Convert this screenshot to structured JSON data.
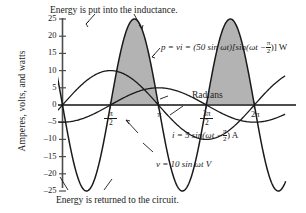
{
  "chart_data": {
    "type": "line",
    "title": "",
    "xlabel": "Radians",
    "ylabel": "Amperes, volts, and watts",
    "xlim": [
      0,
      7.3303
    ],
    "ylim": [
      -27,
      27
    ],
    "grid": false,
    "legend": "annotations",
    "x_ticks": [
      "π/2",
      "π",
      "3π/2",
      "2π"
    ],
    "x_tick_values": [
      1.5708,
      3.1416,
      4.7124,
      6.2832
    ],
    "y_ticks": [
      25,
      20,
      15,
      10,
      5,
      0,
      -5,
      -10,
      -15,
      -20,
      -25
    ],
    "y_tick_labels": [
      "25",
      "20",
      "15",
      "10",
      "5",
      "0",
      "-5",
      "-10",
      "-15",
      "-20",
      "-25"
    ],
    "series": [
      {
        "name": "p = vi",
        "equation": "p = vi = (50 sin ωt)[sin(ωt − π/2)] W",
        "amplitude": 25,
        "formula": "-25*sin(2x)",
        "shaded_positive": true,
        "shaded_color": "#b3b3b3"
      },
      {
        "name": "v",
        "equation": "v = 10 sin ωt V",
        "amplitude": 10,
        "formula": "10*sin(x)"
      },
      {
        "name": "i",
        "equation": "i = 5 sin(ωt − π/2) A",
        "amplitude": 5,
        "formula": "5*sin(x - pi/2)"
      }
    ],
    "annotations": [
      {
        "id": "top-caption",
        "text": "Energy is put into the inductance."
      },
      {
        "id": "bottom-caption",
        "text": "Energy is returned to the circuit."
      },
      {
        "id": "x-axis-label",
        "text": "Radians"
      }
    ]
  },
  "axis": {
    "y_label": "Amperes, volts, and watts",
    "x_label": "Radians",
    "y_ticks": [
      "25",
      "20",
      "15",
      "10",
      "5",
      "0",
      "-5",
      "-10",
      "-15",
      "-20",
      "-25"
    ],
    "x_ticks": [
      {
        "num": "π",
        "den": "2",
        "prefix": ""
      },
      {
        "num": "",
        "den": "",
        "prefix": "π"
      },
      {
        "num": "3π",
        "den": "2",
        "prefix": ""
      },
      {
        "num": "",
        "den": "",
        "prefix": "2π"
      }
    ]
  },
  "captions": {
    "top": "Energy is put into the inductance.",
    "bottom": "Energy is returned to the circuit."
  },
  "equations": {
    "power_lead": "p = vi = (50 sin ωt)[sin(ωt −",
    "power_tail": ")] W",
    "power_frac_num": "π",
    "power_frac_den": "2",
    "current_lead": "i = 5 sin(ωt −",
    "current_tail": ") A",
    "current_frac_num": "π",
    "current_frac_den": "2",
    "voltage": "v = 10 sin ωt V"
  },
  "colors": {
    "curve": "#1a1a1a",
    "shade": "#b3b3b3",
    "axis": "#4d4d4d",
    "text": "#1a1a1a"
  }
}
